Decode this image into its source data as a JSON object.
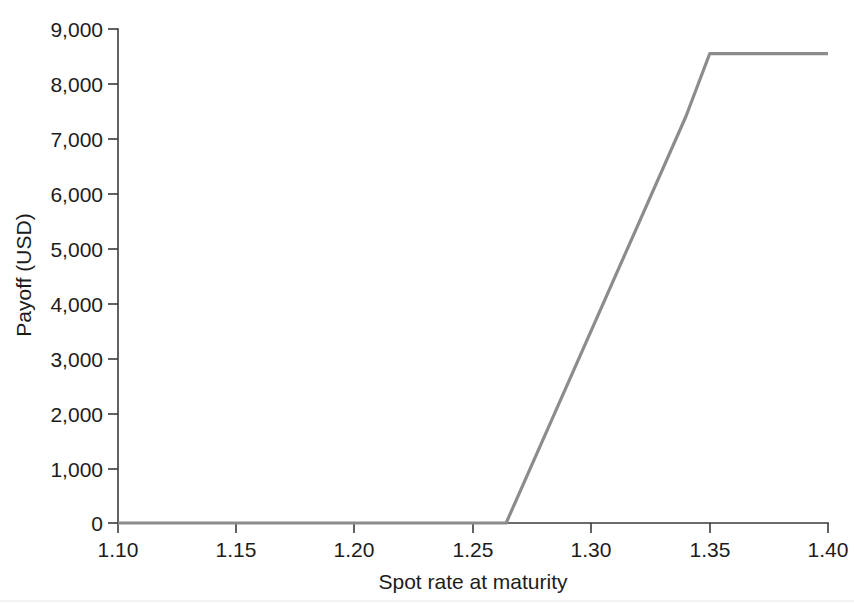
{
  "chart_data": {
    "type": "line",
    "title": "",
    "subtitle": "",
    "xlabel": "Spot rate at maturity",
    "ylabel": "Payoff (USD)",
    "xlim": [
      1.1,
      1.4
    ],
    "ylim": [
      0,
      9000
    ],
    "xticks": [
      1.1,
      1.15,
      1.2,
      1.25,
      1.3,
      1.35,
      1.4
    ],
    "xtick_labels": [
      "1.10",
      "1.15",
      "1.20",
      "1.25",
      "1.30",
      "1.35",
      "1.40"
    ],
    "yticks": [
      0,
      1000,
      2000,
      3000,
      4000,
      5000,
      6000,
      7000,
      8000,
      9000
    ],
    "ytick_labels": [
      "0",
      "1,000",
      "2,000",
      "3,000",
      "4,000",
      "5,000",
      "6,000",
      "7,000",
      "8,000",
      "9,000"
    ],
    "grid": false,
    "legend": null,
    "legend_position": "none",
    "series": [
      {
        "name": "Payoff",
        "color": "#8c8c8c",
        "x": [
          1.1,
          1.15,
          1.2,
          1.25,
          1.264,
          1.28,
          1.3,
          1.32,
          1.34,
          1.35,
          1.36,
          1.38,
          1.4
        ],
        "values": [
          0,
          0,
          0,
          0,
          0,
          1560,
          3510,
          5460,
          7410,
          8550,
          8550,
          8550,
          8550
        ]
      }
    ],
    "annotations": []
  },
  "axis": {
    "x_label": "Spot rate at maturity",
    "y_label": "Payoff (USD)"
  }
}
